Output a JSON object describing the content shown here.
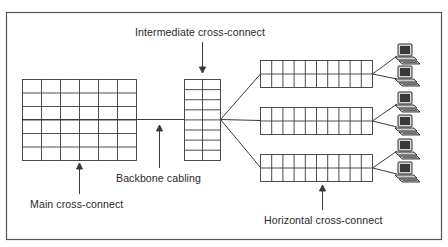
{
  "labels": {
    "intermediate": "Intermediate cross-connect",
    "backbone": "Backbone cabling",
    "main": "Main cross-connect",
    "horizontal": "Horizontal cross-connect"
  },
  "colors": {
    "line": "#3a3a3a",
    "frame": "#555555",
    "monitor": "#2e2e2e",
    "screen": "#5a5a5a",
    "background": "#ffffff"
  },
  "main_cross_connect": {
    "cols": 6,
    "rows": 6
  },
  "intermediate_cross_connect": {
    "cols": 2,
    "rows": 8
  },
  "horizontal_cross_connects": [
    {
      "cols": 10,
      "rows": 2,
      "computers": 2
    },
    {
      "cols": 10,
      "rows": 2,
      "computers": 2
    },
    {
      "cols": 10,
      "rows": 2,
      "computers": 2
    }
  ]
}
